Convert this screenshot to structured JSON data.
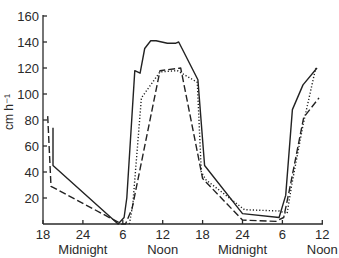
{
  "chart_data": {
    "type": "line",
    "title": "",
    "xlabel": "",
    "ylabel": "cm h⁻¹",
    "ylim": [
      0,
      160
    ],
    "xlim_hours_from_start": [
      0,
      42
    ],
    "grid": false,
    "legend": null,
    "y_ticks": [
      20,
      40,
      60,
      80,
      100,
      120,
      140,
      160
    ],
    "x_ticks": [
      {
        "hour": 0,
        "label": "18"
      },
      {
        "hour": 6,
        "label": "24"
      },
      {
        "hour": 12,
        "label": "6"
      },
      {
        "hour": 18,
        "label": "12"
      },
      {
        "hour": 24,
        "label": "18"
      },
      {
        "hour": 30,
        "label": "24"
      },
      {
        "hour": 36,
        "label": "6"
      },
      {
        "hour": 42,
        "label": "12"
      }
    ],
    "x_sublabels": [
      {
        "hour": 6,
        "label": "Midnight"
      },
      {
        "hour": 18,
        "label": "Noon"
      },
      {
        "hour": 30,
        "label": "Midnight"
      },
      {
        "hour": 42,
        "label": "Noon"
      }
    ],
    "series": [
      {
        "name": "solid",
        "style": "solid",
        "x": [
          1.5,
          1.5,
          11.3,
          12.2,
          12.6,
          13.8,
          14.6,
          15.3,
          16.2,
          17.0,
          18.7,
          19.9,
          20.4,
          23.3,
          24.3,
          30.0,
          35.5,
          36.5,
          37.5,
          39.1,
          41.2
        ],
        "values": [
          74,
          45,
          0,
          5,
          20,
          118,
          116,
          135,
          141,
          141,
          139,
          139,
          140,
          111,
          45,
          8,
          5,
          22,
          88,
          107,
          120
        ]
      },
      {
        "name": "dotted",
        "style": "dotted",
        "x": [
          13.0,
          13.5,
          14.8,
          17.6,
          20.2,
          23.2,
          23.8,
          24.5,
          30.3,
          35.5,
          36.7,
          37.4,
          39.1,
          41.0
        ],
        "values": [
          0,
          15,
          97,
          117,
          118,
          109,
          40,
          34,
          11,
          10,
          8,
          30,
          76,
          120
        ]
      },
      {
        "name": "dashed",
        "style": "dashed",
        "x": [
          0.7,
          1.2,
          11.8,
          12.4,
          13.4,
          17.6,
          20.7,
          24.0,
          30.0,
          35.0,
          36.2,
          37.0,
          39.2,
          41.5
        ],
        "values": [
          83,
          29,
          0,
          0,
          12,
          118,
          120,
          35,
          3,
          2,
          5,
          25,
          82,
          97
        ]
      }
    ]
  }
}
